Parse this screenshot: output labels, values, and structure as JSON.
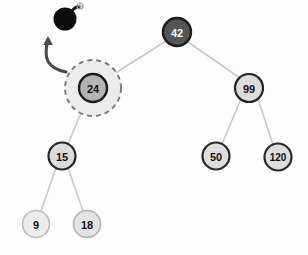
{
  "diagram": {
    "background_color": "#fdfdfd",
    "edge_color": "#c9c9c9",
    "annotation": {
      "bomb_icon_name": "bomb-icon",
      "bomb_color": "#0d0d0d",
      "spark_color": "#9a9a9a",
      "arrow_color": "#4a4a4a",
      "arrow_meaning": "delete"
    },
    "highlight": {
      "node": "24",
      "style": "dashed-halo",
      "halo_fill": "#ececec",
      "halo_stroke": "#7a7a7a",
      "halo_radius": 28
    },
    "nodes": [
      {
        "id": "n42",
        "label": "42",
        "cx": 177,
        "cy": 32,
        "r": 14,
        "fill": "#545454",
        "stroke": "#1c1c1c",
        "stroke_width": 2.4,
        "text_color": "#ffffff",
        "font_size": 11
      },
      {
        "id": "n24",
        "label": "24",
        "cx": 93,
        "cy": 88,
        "r": 14,
        "fill": "#b4b4b4",
        "stroke": "#1c1c1c",
        "stroke_width": 2.4,
        "text_color": "#111111",
        "font_size": 11
      },
      {
        "id": "n99",
        "label": "99",
        "cx": 249,
        "cy": 88,
        "r": 14,
        "fill": "#dcdcdc",
        "stroke": "#242424",
        "stroke_width": 2.2,
        "text_color": "#111111",
        "font_size": 11
      },
      {
        "id": "n15",
        "label": "15",
        "cx": 62,
        "cy": 156,
        "r": 13.5,
        "fill": "#dcdcdc",
        "stroke": "#262626",
        "stroke_width": 2.2,
        "text_color": "#111111",
        "font_size": 11
      },
      {
        "id": "n50",
        "label": "50",
        "cx": 216,
        "cy": 156,
        "r": 13.5,
        "fill": "#dedede",
        "stroke": "#2a2a2a",
        "stroke_width": 2.2,
        "text_color": "#111111",
        "font_size": 11
      },
      {
        "id": "n120",
        "label": "120",
        "cx": 278,
        "cy": 157,
        "r": 13.5,
        "fill": "#dedede",
        "stroke": "#2a2a2a",
        "stroke_width": 2.2,
        "text_color": "#111111",
        "font_size": 10
      },
      {
        "id": "n9",
        "label": "9",
        "cx": 36,
        "cy": 224,
        "r": 13.5,
        "fill": "#ededed",
        "stroke": "#bdbdbd",
        "stroke_width": 1.6,
        "text_color": "#111111",
        "font_size": 11
      },
      {
        "id": "n18",
        "label": "18",
        "cx": 87,
        "cy": 224,
        "r": 13.5,
        "fill": "#e4e4e4",
        "stroke": "#b0b0b0",
        "stroke_width": 1.6,
        "text_color": "#111111",
        "font_size": 11
      }
    ],
    "edges": [
      {
        "id": "e42-24",
        "from": "42",
        "to": "24",
        "x1": 166,
        "y1": 41,
        "x2": 106,
        "y2": 79
      },
      {
        "id": "e42-99",
        "from": "42",
        "to": "99",
        "x1": 188,
        "y1": 42,
        "x2": 240,
        "y2": 78
      },
      {
        "id": "e24-15",
        "from": "24",
        "to": "15",
        "x1": 86,
        "y1": 101,
        "x2": 68,
        "y2": 144
      },
      {
        "id": "e99-50",
        "from": "99",
        "to": "50",
        "x1": 241,
        "y1": 99,
        "x2": 222,
        "y2": 144
      },
      {
        "id": "e99-120",
        "from": "99",
        "to": "120",
        "x1": 258,
        "y1": 99,
        "x2": 273,
        "y2": 145
      },
      {
        "id": "e15-9",
        "from": "15",
        "to": "9",
        "x1": 56,
        "y1": 168,
        "x2": 41,
        "y2": 211
      },
      {
        "id": "e15-18",
        "from": "15",
        "to": "18",
        "x1": 68,
        "y1": 168,
        "x2": 83,
        "y2": 211
      }
    ],
    "values_in_order": [
      "9",
      "15",
      "18",
      "24",
      "42",
      "50",
      "99",
      "120"
    ]
  }
}
